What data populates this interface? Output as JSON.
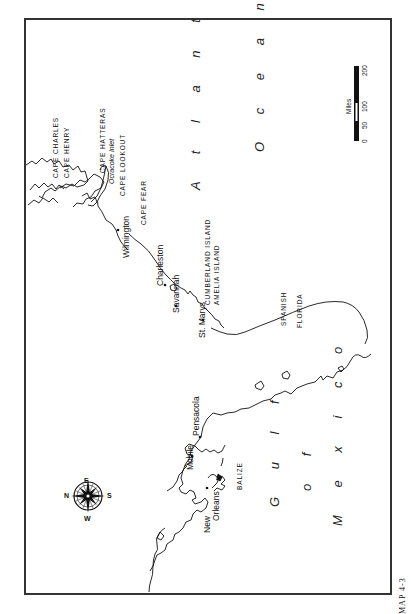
{
  "map": {
    "caption": "MAP 4-3",
    "orientation": "rotated 90° counter-clockwise",
    "water_labels": {
      "atlantic": "A t l a n t i c",
      "ocean": "O c e a n",
      "gulf": "G u l f",
      "of": "o f",
      "mexico": "M e x i c o"
    },
    "places": {
      "cape_charles": "CAPE CHARLES",
      "cape_henry": "CAPE HENRY",
      "cape_hatteras": "CAPE HATTERAS",
      "ocracoke_inlet": "Ocracoke Inlet",
      "cape_lookout": "CAPE LOOKOUT",
      "cape_fear": "CAPE FEAR",
      "wilmington": "Wilmington",
      "charleston": "Charleston",
      "savannah": "Savannah",
      "st_marys": "St. Marys",
      "cumberland_island": "CUMBERLAND ISLAND",
      "amelia_island": "AMELIA ISLAND",
      "spanish": "SPANISH",
      "florida": "FLORIDA",
      "pensacola": "Pensacola",
      "mobile": "Mobile",
      "new": "New",
      "orleans": "Orleans",
      "balize": "BALIZE"
    },
    "compass": {
      "n": "N",
      "e": "E",
      "s": "S",
      "w": "W"
    },
    "scale_bar": {
      "unit": "Miles",
      "ticks": [
        "0",
        "50",
        "100",
        "200"
      ]
    }
  }
}
